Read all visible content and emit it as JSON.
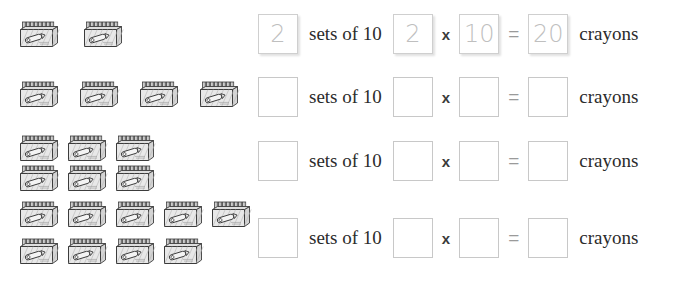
{
  "worksheet": {
    "unit_size": 10,
    "unit_noun": "crayons",
    "sets_label": "sets of 10",
    "operator_multiply": "x",
    "operator_equals": "=",
    "icon_name": "crayon-box-icon",
    "colors": {
      "answer_text": "#bfbfbf",
      "box_border": "#c8c8c8",
      "body_text": "#2b2b2b",
      "icon_ink": "#3c3c3c",
      "icon_fill": "#e8e8e8"
    },
    "rows": [
      {
        "id": "row-1",
        "box_count": 2,
        "icon_lines": [
          2
        ],
        "prefilled": true,
        "sets_value": "2",
        "factor_a": "2",
        "factor_b": "10",
        "product": "20"
      },
      {
        "id": "row-2",
        "box_count": 4,
        "icon_lines": [
          4
        ],
        "prefilled": false,
        "sets_value": "",
        "factor_a": "",
        "factor_b": "",
        "product": ""
      },
      {
        "id": "row-3",
        "box_count": 6,
        "icon_lines": [
          3,
          3
        ],
        "prefilled": false,
        "sets_value": "",
        "factor_a": "",
        "factor_b": "",
        "product": ""
      },
      {
        "id": "row-4",
        "box_count": 9,
        "icon_lines": [
          5,
          4
        ],
        "prefilled": false,
        "sets_value": "",
        "factor_a": "",
        "factor_b": "",
        "product": ""
      }
    ]
  }
}
